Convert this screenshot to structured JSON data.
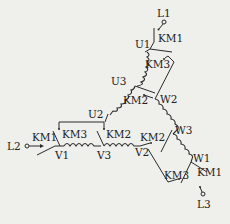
{
  "diagram": {
    "type": "three-phase motor winding wiring (delta/star contactor switching)",
    "terminals": [
      {
        "id": "L1",
        "label": "L1"
      },
      {
        "id": "L2",
        "label": "L2"
      },
      {
        "id": "L3",
        "label": "L3"
      }
    ],
    "winding_nodes": {
      "U1": "U1",
      "U2": "U2",
      "U3": "U3",
      "V1": "V1",
      "V2": "V2",
      "V3": "V3",
      "W1": "W1",
      "W2": "W2",
      "W3": "W3"
    },
    "contactors": {
      "km1_top": "KM1",
      "km1_left": "KM1",
      "km1_bottom": "KM1",
      "km3_top": "KM3",
      "km3_left": "KM3",
      "km3_bottom": "KM3",
      "km2_center": "KM2",
      "km2_left": "KM2",
      "km2_right": "KM2"
    },
    "colors": {
      "line": "#2a2a2a",
      "background": "#efefec"
    }
  }
}
